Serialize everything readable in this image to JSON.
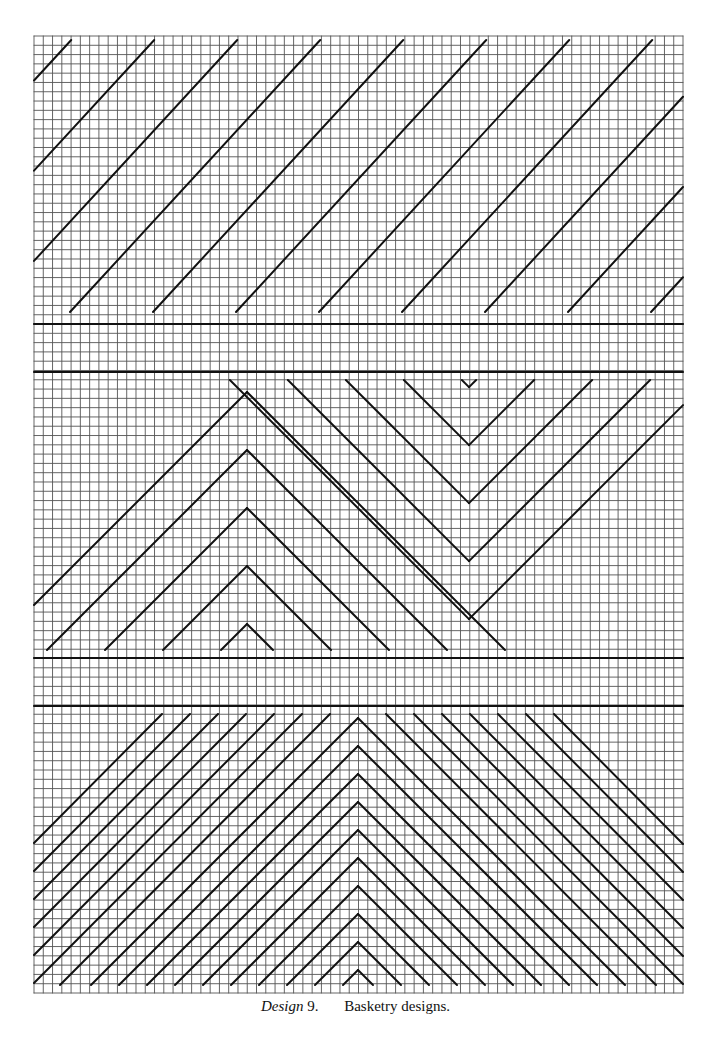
{
  "caption": {
    "design": "Design",
    "number": "9.",
    "text": "Basketry designs."
  },
  "grid": {
    "x0": 34,
    "y0": 36,
    "x1": 683,
    "y1": 993,
    "cols": 70,
    "rows": 103,
    "grid_color": "#555555",
    "line_color": "#111111"
  },
  "bands": [
    {
      "y": 324
    },
    {
      "y": 372
    },
    {
      "y": 658
    },
    {
      "y": 706
    }
  ],
  "sections": [
    {
      "name": "top-diagonals",
      "y_top": 36,
      "y_bottom": 312,
      "pattern": "diagonal-up",
      "spacing": 83
    },
    {
      "name": "middle-chevrons",
      "y_top": 380,
      "y_bottom": 650,
      "pattern": "chevron-nested",
      "apex_up_x": 247,
      "apex_down_x": 469
    },
    {
      "name": "bottom-chevrons",
      "y_top": 714,
      "y_bottom": 985,
      "pattern": "chevron-dense",
      "apex_x": 358
    }
  ]
}
